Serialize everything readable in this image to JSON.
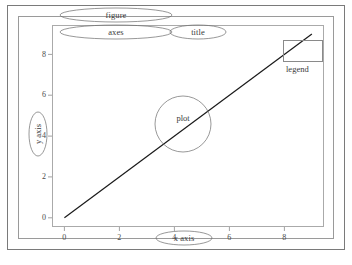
{
  "chart_data": {
    "type": "line",
    "title": "",
    "xlabel": "x axis",
    "ylabel": "y axis",
    "xlim": [
      -0.45,
      9.45
    ],
    "ylim": [
      -0.45,
      9.45
    ],
    "xticks": [
      "0",
      "2",
      "4",
      "6",
      "8"
    ],
    "xtick_values": [
      0,
      2,
      4,
      6,
      8
    ],
    "yticks": [
      "0",
      "2",
      "4",
      "6",
      "8"
    ],
    "ytick_values": [
      0,
      2,
      4,
      6,
      8
    ],
    "grid": false,
    "legend_position": "upper right",
    "series": [
      {
        "name": "line",
        "color": "#1a1a1a",
        "x": [
          0,
          9
        ],
        "values": [
          0,
          9
        ]
      }
    ]
  },
  "annotations": {
    "figure": "figure",
    "axes": "axes",
    "title": "title",
    "plot": "plot",
    "legend": "legend",
    "x_axis": "x axis",
    "y_axis": "y axis"
  },
  "colors": {
    "line": "#1a1a1a",
    "frame": "#8a8a8a",
    "annotation_outline": "#6b6b6b",
    "text": "#3a3a3a",
    "background": "#ffffff"
  }
}
